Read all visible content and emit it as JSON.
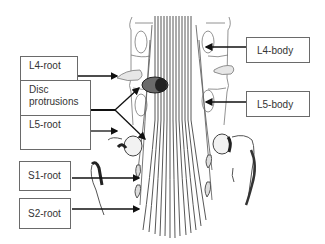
{
  "diagram": {
    "labels": {
      "l4_root": "L4-root",
      "disc_protrusions_line1": "Disc",
      "disc_protrusions_line2": "protrusions",
      "l5_root": "L5-root",
      "s1_root": "S1-root",
      "s2_root": "S2-root",
      "l4_body": "L4-body",
      "l5_body": "L5-body"
    },
    "colors": {
      "line": "#111111",
      "box_border": "#6a6a6a",
      "text": "#333333",
      "drawing": "#555555",
      "disc_fill": "#555555"
    }
  }
}
